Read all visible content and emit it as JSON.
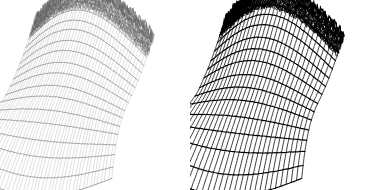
{
  "figure": {
    "type": "wireframe-mesh-comparison",
    "background_color": "#ffffff",
    "width": 381,
    "height": 190,
    "panel_count": 2,
    "caption": ""
  },
  "panels": [
    {
      "id": "left-wireframe-plot",
      "name": "left-mesh-surface",
      "label": "",
      "render_style": "thin-light-wireframe",
      "line_color": "#8c8c8c",
      "accent_color": "#3a3a3a",
      "line_width": 0.35,
      "accent_line_width": 0.6,
      "u_lines": 44,
      "v_lines": 17,
      "noise_amplitude": 0.55,
      "crest_noise_amplitude": 2.6,
      "opacity": 0.78
    },
    {
      "id": "right-wireframe-plot",
      "name": "right-mesh-surface",
      "label": "",
      "render_style": "bold-dark-wireframe",
      "line_color": "#1a1a1a",
      "accent_color": "#000000",
      "line_width": 0.85,
      "accent_line_width": 1.15,
      "u_lines": 30,
      "v_lines": 15,
      "noise_amplitude": 0.35,
      "crest_noise_amplitude": 2.2,
      "opacity": 1.0
    }
  ],
  "chart_data": {
    "type": "line",
    "title": "",
    "xlabel": "",
    "ylabel": "",
    "grid": false,
    "legend": "none",
    "surface": {
      "u_range": [
        0,
        1
      ],
      "v_range": [
        0,
        1
      ],
      "camera_azimuth_deg": -38,
      "camera_elevation_deg": 22,
      "projection": "oblique"
    },
    "series": [
      {
        "name": "left-mesh",
        "mesh_density_u": 44,
        "mesh_density_v": 17,
        "stroke": "#8c8c8c",
        "values": [
          0.02,
          0.11,
          0.24,
          0.39,
          0.54,
          0.68,
          0.79,
          0.87,
          0.92,
          0.95,
          0.93,
          0.86,
          0.74,
          0.58,
          0.4,
          0.22,
          0.08
        ]
      },
      {
        "name": "right-mesh",
        "mesh_density_u": 30,
        "mesh_density_v": 15,
        "stroke": "#1a1a1a",
        "values": [
          0.02,
          0.11,
          0.24,
          0.39,
          0.54,
          0.68,
          0.79,
          0.87,
          0.92,
          0.95,
          0.93,
          0.86,
          0.74,
          0.58,
          0.4,
          0.22,
          0.08
        ]
      }
    ],
    "crest_profile": {
      "note": "Noisy high-frequency ridge along the top of each surface",
      "x": [
        0.0,
        0.1,
        0.2,
        0.3,
        0.4,
        0.5,
        0.6,
        0.7,
        0.8,
        0.9,
        1.0
      ],
      "values": [
        0.55,
        0.78,
        0.94,
        1.02,
        1.06,
        1.08,
        1.05,
        0.98,
        0.88,
        0.72,
        0.5
      ]
    },
    "skirt_profile": {
      "note": "Flat fanned shelf curling outward at the lower edge",
      "x": [
        0.0,
        0.25,
        0.5,
        0.75,
        1.0
      ],
      "values": [
        -0.62,
        -0.7,
        -0.74,
        -0.68,
        -0.55
      ]
    }
  }
}
